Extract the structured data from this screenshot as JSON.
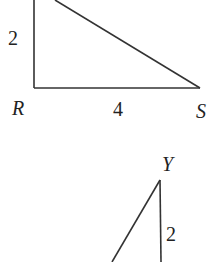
{
  "diagram": {
    "triangle_top": {
      "vertices": [
        "R",
        "S"
      ],
      "side_labels": {
        "vertical": "2",
        "horizontal": "4"
      },
      "vertex_labels": {
        "R": "R",
        "S": "S"
      }
    },
    "triangle_bottom": {
      "vertex_labels": {
        "Y": "Y"
      },
      "side_labels": {
        "vertical": "2"
      }
    },
    "colors": {
      "line": "#333333",
      "background": "#ffffff"
    }
  }
}
